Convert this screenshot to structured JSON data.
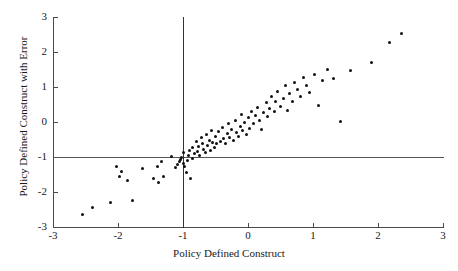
{
  "chart_data": {
    "type": "scatter",
    "title": "",
    "xlabel": "Policy Defined Construct",
    "ylabel": "Policy Defined Construct with Error",
    "xlim": [
      -3,
      3
    ],
    "ylim": [
      -3,
      3
    ],
    "xticks": [
      -3,
      -2,
      -1,
      0,
      1,
      2,
      3
    ],
    "yticks": [
      -3,
      -2,
      -1,
      0,
      1,
      2,
      3
    ],
    "xtick_labels": [
      "-3",
      "-2",
      "-1",
      "0",
      "1",
      "2",
      "3"
    ],
    "ytick_labels": [
      "-3",
      "-2",
      "-1",
      "0",
      "1",
      "2",
      "3"
    ],
    "grid": false,
    "legend": null,
    "reference_lines": [
      {
        "orientation": "horizontal",
        "value": -1,
        "label": "y = -1"
      },
      {
        "orientation": "vertical",
        "value": -1,
        "label": "x = -1"
      }
    ],
    "marker": {
      "shape": "circle",
      "color": "#111111",
      "size": 3
    },
    "n_points": 103,
    "points": [
      [
        -2.55,
        -2.63
      ],
      [
        -2.4,
        -2.45
      ],
      [
        -2.12,
        -2.31
      ],
      [
        -2.02,
        -1.28
      ],
      [
        -1.97,
        -1.55
      ],
      [
        -1.94,
        -1.42
      ],
      [
        -1.86,
        -1.68
      ],
      [
        -1.78,
        -2.25
      ],
      [
        -1.62,
        -1.34
      ],
      [
        -1.45,
        -1.6
      ],
      [
        -1.4,
        -1.28
      ],
      [
        -1.37,
        -1.73
      ],
      [
        -1.33,
        -1.12
      ],
      [
        -1.3,
        -1.55
      ],
      [
        -1.18,
        -0.98
      ],
      [
        -1.12,
        -1.3
      ],
      [
        -1.08,
        -1.2
      ],
      [
        -1.06,
        -1.12
      ],
      [
        -1.04,
        -1.08
      ],
      [
        -1.02,
        -1.02
      ],
      [
        -1.0,
        -0.88
      ],
      [
        -0.99,
        -1.18
      ],
      [
        -0.97,
        -1.28
      ],
      [
        -0.95,
        -1.45
      ],
      [
        -0.93,
        -1.1
      ],
      [
        -0.92,
        -0.97
      ],
      [
        -0.9,
        -0.82
      ],
      [
        -0.88,
        -1.62
      ],
      [
        -0.86,
        -0.72
      ],
      [
        -0.85,
        -1.05
      ],
      [
        -0.83,
        -0.9
      ],
      [
        -0.8,
        -0.55
      ],
      [
        -0.78,
        -0.85
      ],
      [
        -0.76,
        -0.7
      ],
      [
        -0.74,
        -0.95
      ],
      [
        -0.72,
        -0.45
      ],
      [
        -0.7,
        -0.62
      ],
      [
        -0.68,
        -0.78
      ],
      [
        -0.66,
        -0.88
      ],
      [
        -0.64,
        -0.35
      ],
      [
        -0.62,
        -0.68
      ],
      [
        -0.6,
        -0.52
      ],
      [
        -0.58,
        -0.8
      ],
      [
        -0.56,
        -0.25
      ],
      [
        -0.54,
        -0.58
      ],
      [
        -0.52,
        -0.72
      ],
      [
        -0.5,
        -0.42
      ],
      [
        -0.48,
        -0.62
      ],
      [
        -0.45,
        -0.28
      ],
      [
        -0.42,
        -0.55
      ],
      [
        -0.4,
        -0.15
      ],
      [
        -0.38,
        -0.48
      ],
      [
        -0.35,
        -0.62
      ],
      [
        -0.32,
        -0.32
      ],
      [
        -0.3,
        -0.05
      ],
      [
        -0.28,
        -0.45
      ],
      [
        -0.25,
        -0.22
      ],
      [
        -0.22,
        -0.52
      ],
      [
        -0.2,
        0.05
      ],
      [
        -0.18,
        -0.3
      ],
      [
        -0.15,
        -0.4
      ],
      [
        -0.12,
        -0.12
      ],
      [
        -0.1,
        0.22
      ],
      [
        -0.08,
        -0.25
      ],
      [
        -0.05,
        -0.02
      ],
      [
        -0.02,
        -0.35
      ],
      [
        0.0,
        0.12
      ],
      [
        0.03,
        -0.18
      ],
      [
        0.05,
        0.3
      ],
      [
        0.08,
        -0.05
      ],
      [
        0.12,
        0.18
      ],
      [
        0.15,
        0.42
      ],
      [
        0.18,
        0.05
      ],
      [
        0.2,
        -0.22
      ],
      [
        0.24,
        0.28
      ],
      [
        0.28,
        0.55
      ],
      [
        0.3,
        0.15
      ],
      [
        0.33,
        0.4
      ],
      [
        0.36,
        0.72
      ],
      [
        0.4,
        0.3
      ],
      [
        0.43,
        0.58
      ],
      [
        0.46,
        0.88
      ],
      [
        0.5,
        0.45
      ],
      [
        0.54,
        0.68
      ],
      [
        0.58,
        1.05
      ],
      [
        0.6,
        0.32
      ],
      [
        0.64,
        0.82
      ],
      [
        0.68,
        0.58
      ],
      [
        0.72,
        1.12
      ],
      [
        0.76,
        0.92
      ],
      [
        0.8,
        0.72
      ],
      [
        0.85,
        1.28
      ],
      [
        0.9,
        1.05
      ],
      [
        0.95,
        0.85
      ],
      [
        1.02,
        1.35
      ],
      [
        1.08,
        0.48
      ],
      [
        1.14,
        1.18
      ],
      [
        1.22,
        1.5
      ],
      [
        1.32,
        1.25
      ],
      [
        1.42,
        0.02
      ],
      [
        1.58,
        1.48
      ],
      [
        1.9,
        1.7
      ],
      [
        2.18,
        2.28
      ],
      [
        2.36,
        2.52
      ]
    ]
  }
}
